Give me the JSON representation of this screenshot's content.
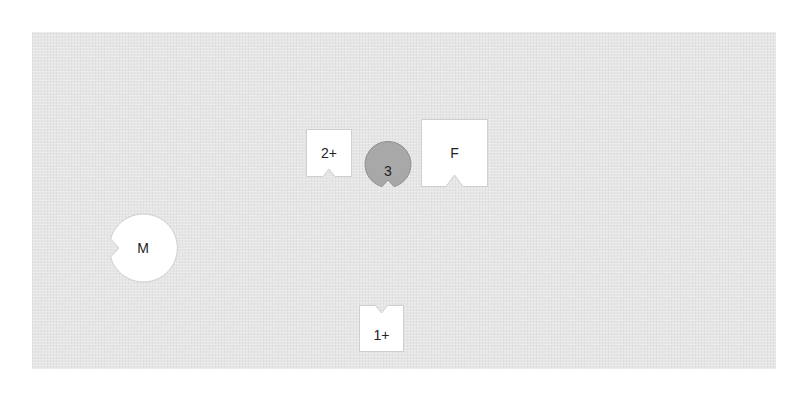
{
  "board": {
    "background": "#e6e6e6"
  },
  "pieces": {
    "two_plus": {
      "label": "2+",
      "shape": "square-notched-bottom",
      "fill": "#ffffff"
    },
    "three": {
      "label": "3",
      "shape": "circle-notched-bottom",
      "fill": "#a8a8a8"
    },
    "f": {
      "label": "F",
      "shape": "square-notched-bottom",
      "fill": "#ffffff"
    },
    "m": {
      "label": "M",
      "shape": "circle-notched-left",
      "fill": "#ffffff"
    },
    "one_plus": {
      "label": "1+",
      "shape": "square-notched-top",
      "fill": "#ffffff"
    }
  }
}
